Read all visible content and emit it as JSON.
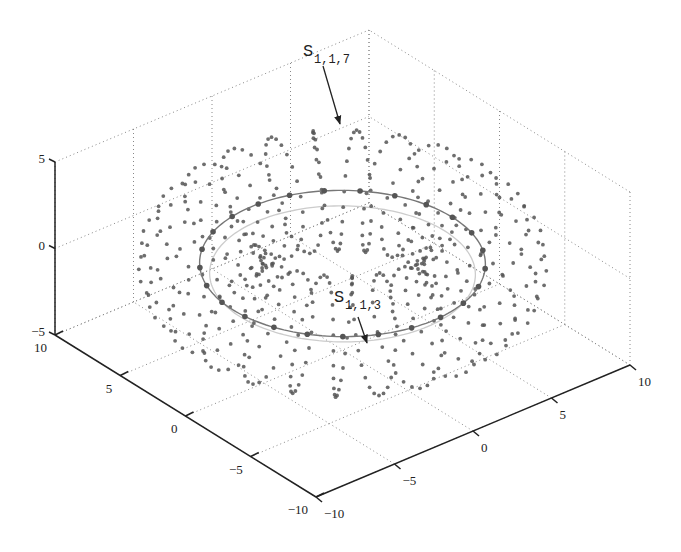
{
  "chart_data": {
    "type": "scatter3d",
    "title": "",
    "xlabel": "",
    "ylabel": "",
    "zlabel": "",
    "xlim": [
      -10,
      10
    ],
    "ylim": [
      -10,
      10
    ],
    "zlim": [
      -5,
      5
    ],
    "x_ticks": [
      "-10",
      "-5",
      "0",
      "5",
      "10"
    ],
    "y_ticks": [
      "-10",
      "-5",
      "0",
      "5",
      "10"
    ],
    "z_ticks": [
      "-5",
      "0",
      "5"
    ],
    "grid": true,
    "legend": null,
    "series": [
      {
        "name": "helical points on torus",
        "kind": "scatter",
        "major_radius": 7,
        "minor_radius": 3,
        "turns": 25,
        "points_per_turn": 24,
        "color": "#555555"
      },
      {
        "name": "torus centerline (front)",
        "kind": "line",
        "radius": 7,
        "z": 0,
        "color": "#777777",
        "marker_count": 25
      },
      {
        "name": "inner reference circle",
        "kind": "line",
        "radius": 7,
        "z": 0,
        "color": "#cccccc"
      }
    ],
    "annotations": [
      {
        "text": "S",
        "subscript": "1,1,7",
        "label_xy": [
          303,
          56
        ],
        "arrow_from": [
          323,
          66
        ],
        "arrow_to": [
          340,
          124
        ]
      },
      {
        "text": "S",
        "subscript": "1,1,3",
        "label_xy": [
          334,
          302
        ],
        "arrow_from": [
          358,
          317
        ],
        "arrow_to": [
          367,
          343
        ]
      }
    ]
  }
}
